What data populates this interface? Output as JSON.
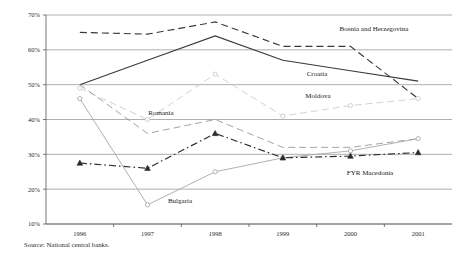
{
  "chart_data": {
    "type": "line",
    "title": "",
    "xlabel": "",
    "ylabel": "",
    "categories": [
      "1996",
      "1997",
      "1998",
      "1999",
      "2000",
      "2001"
    ],
    "ylim": [
      10,
      70
    ],
    "ytick_labels": [
      "10%",
      "20%",
      "30%",
      "40%",
      "50%",
      "60%",
      "70%"
    ],
    "ytick_values": [
      10,
      20,
      30,
      40,
      50,
      60,
      70
    ],
    "grid": true,
    "legend_position": "inline-labels",
    "series": [
      {
        "name": "Bosnia and Herzegovina",
        "label": "Bosnia and Herzegovina",
        "values": [
          65.0,
          64.5,
          68.0,
          61.0,
          61.0,
          46.0
        ],
        "style": "dashed",
        "color": "#3a3a3a",
        "marker": "none"
      },
      {
        "name": "Croatia",
        "label": "Croatia",
        "values": [
          50.0,
          57.0,
          64.0,
          57.0,
          54.0,
          51.0
        ],
        "style": "solid",
        "color": "#3a3a3a",
        "marker": "none"
      },
      {
        "name": "Moldova",
        "label": "Moldova",
        "values": [
          49.0,
          40.0,
          53.0,
          41.0,
          44.0,
          46.0
        ],
        "style": "dashed",
        "color": "#cccccc",
        "marker": "circle"
      },
      {
        "name": "Romania",
        "label": "Romania",
        "values": [
          50.0,
          36.0,
          40.0,
          32.0,
          32.0,
          34.5
        ],
        "style": "dashed",
        "color": "#9a9a9a",
        "marker": "none"
      },
      {
        "name": "Bulgaria",
        "label": "Bulgaria",
        "values": [
          46.0,
          15.5,
          25.0,
          29.0,
          31.0,
          34.5
        ],
        "style": "solid",
        "color": "#a8a8a8",
        "marker": "circle"
      },
      {
        "name": "FYR Macedonia",
        "label": "FYR Macedonia",
        "values": [
          27.5,
          26.0,
          36.0,
          29.0,
          29.5,
          30.5
        ],
        "style": "dashdot",
        "color": "#2b2b2b",
        "marker": "triangle"
      }
    ],
    "annotations": [
      {
        "text": "Bosnia and Herzegovina",
        "x": 374,
        "y": 31
      },
      {
        "text": "Croatia",
        "x": 317,
        "y": 76
      },
      {
        "text": "Moldova",
        "x": 318,
        "y": 98
      },
      {
        "text": "Romania",
        "x": 161,
        "y": 115
      },
      {
        "text": "Bulgaria",
        "x": 180,
        "y": 203
      },
      {
        "text": "FYR Macedonia",
        "x": 370,
        "y": 175
      }
    ]
  },
  "source": {
    "note": "Source: National central banks."
  }
}
